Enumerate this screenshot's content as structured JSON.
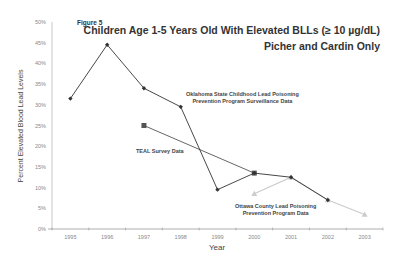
{
  "figure_label": "Figure 5",
  "title": "Children Age 1-5 Years Old With Elevated BLLs (≥ 10 µg/dL)",
  "subtitle": "Picher and Cardin Only",
  "ylabel": "Percent Elevated Blood Lead Levels",
  "xlabel": "Year",
  "annotations": {
    "oklahoma": [
      "Oklahoma State Childhood Lead Poisoning",
      "Prevention Program Surveillance Data"
    ],
    "teal": "TEAL Survey Data",
    "ottawa": [
      "Ottawa County Lead Poisoning",
      "Prevention Program Data"
    ]
  },
  "chart_data": {
    "type": "line",
    "xlabel": "Year",
    "ylabel": "Percent Elevated Blood Lead Levels",
    "categories": [
      "1995",
      "1996",
      "1997",
      "1998",
      "1999",
      "2000",
      "2001",
      "2002",
      "2003"
    ],
    "yticks": [
      "0%",
      "5%",
      "10%",
      "15%",
      "20%",
      "25%",
      "30%",
      "35%",
      "40%",
      "45%",
      "50%"
    ],
    "ylim": [
      0,
      50
    ],
    "grid": false,
    "legend": "inline annotations",
    "series": [
      {
        "name": "Oklahoma State Childhood Lead Poisoning Prevention Program Surveillance Data",
        "marker": "diamond",
        "color": "#333333",
        "values": [
          31.5,
          44.5,
          34,
          29.5,
          9.5,
          13.5,
          12.5,
          7,
          null
        ]
      },
      {
        "name": "TEAL Survey Data",
        "marker": "square",
        "color": "#555555",
        "values": [
          null,
          null,
          25,
          null,
          null,
          13.5,
          null,
          null,
          null
        ]
      },
      {
        "name": "Ottawa County Lead Poisoning Prevention Program Data",
        "marker": "triangle",
        "color": "#cccccc",
        "values": [
          null,
          null,
          null,
          null,
          null,
          8.5,
          12.5,
          7,
          3.5
        ]
      }
    ]
  }
}
